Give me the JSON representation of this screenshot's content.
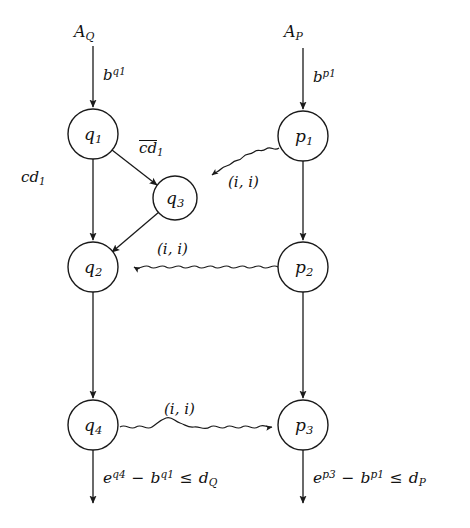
{
  "diagram": {
    "background_color": "#ffffff",
    "stroke_color": "#1a1a1a",
    "nodes": [
      {
        "id": "q1",
        "label": "q",
        "sub": "1",
        "cx": 93,
        "cy": 134,
        "r": 25
      },
      {
        "id": "q3",
        "label": "q",
        "sub": "3",
        "cx": 175,
        "cy": 198,
        "r": 22
      },
      {
        "id": "q2",
        "label": "q",
        "sub": "2",
        "cx": 93,
        "cy": 267,
        "r": 25
      },
      {
        "id": "q4",
        "label": "q",
        "sub": "4",
        "cx": 93,
        "cy": 425,
        "r": 25
      },
      {
        "id": "p1",
        "label": "p",
        "sub": "1",
        "cx": 303,
        "cy": 136,
        "r": 25
      },
      {
        "id": "p2",
        "label": "p",
        "sub": "2",
        "cx": 303,
        "cy": 267,
        "r": 25
      },
      {
        "id": "p3",
        "label": "p",
        "sub": "3",
        "cx": 303,
        "cy": 425,
        "r": 25
      }
    ],
    "entry_labels": [
      {
        "id": "entry-q",
        "text": "A",
        "sub": "Q",
        "x": 74,
        "y": 24
      },
      {
        "id": "entry-p",
        "text": "A",
        "sub": "P",
        "x": 284,
        "y": 24
      }
    ],
    "clock_labels": [
      {
        "id": "clock-bq1",
        "base": "b",
        "sup": "q1",
        "x": 103,
        "y": 67
      },
      {
        "id": "clock-bp1",
        "base": "b",
        "sup": "p1",
        "x": 313,
        "y": 69
      }
    ],
    "edge_labels": [
      {
        "id": "label-cd1",
        "text": "cd",
        "sub": "1",
        "overline": false,
        "x": 21,
        "y": 170
      },
      {
        "id": "label-cd1-bar",
        "text": "cd",
        "sub": "1",
        "overline": true,
        "x": 139,
        "y": 140
      }
    ],
    "sync_labels": [
      {
        "id": "sync-p1-q3",
        "text": "(i, i)",
        "x": 228,
        "y": 175
      },
      {
        "id": "sync-p2-q2",
        "text": "(i, i)",
        "x": 157,
        "y": 242
      },
      {
        "id": "sync-q4-p3",
        "text": "(i, i)",
        "x": 164,
        "y": 402
      }
    ],
    "guards": [
      {
        "id": "guard-q",
        "x": 103,
        "y": 469,
        "parts": [
          {
            "base": "e",
            "sup": "q4"
          },
          {
            "op": " − "
          },
          {
            "base": "b",
            "sup": "q1"
          },
          {
            "op": " ≤ "
          },
          {
            "base": "d",
            "sub": "Q"
          }
        ],
        "plain": "e^{q4} - b^{q1} <= d_Q"
      },
      {
        "id": "guard-p",
        "x": 313,
        "y": 469,
        "parts": [
          {
            "base": "e",
            "sup": "p3"
          },
          {
            "op": " − "
          },
          {
            "base": "b",
            "sup": "p1"
          },
          {
            "op": " ≤ "
          },
          {
            "base": "d",
            "sub": "P"
          }
        ],
        "plain": "e^{p3} - b^{p1} <= d_P"
      }
    ],
    "edges": [
      {
        "id": "edge-entry-q1",
        "type": "straight",
        "from": "entry",
        "to": "q1",
        "label": "b^{q1}"
      },
      {
        "id": "edge-entry-p1",
        "type": "straight",
        "from": "entry",
        "to": "p1",
        "label": "b^{p1}"
      },
      {
        "id": "edge-q1-q2",
        "type": "straight",
        "from": "q1",
        "to": "q2",
        "label": "cd1"
      },
      {
        "id": "edge-q1-q3",
        "type": "straight",
        "from": "q1",
        "to": "q3",
        "label": "cd1-bar"
      },
      {
        "id": "edge-q3-q2",
        "type": "straight",
        "from": "q3",
        "to": "q2",
        "label": ""
      },
      {
        "id": "edge-p1-q3",
        "type": "wavy",
        "from": "p1",
        "to": "q3",
        "label": "(i, i)"
      },
      {
        "id": "edge-p1-p2",
        "type": "straight",
        "from": "p1",
        "to": "p2",
        "label": ""
      },
      {
        "id": "edge-p2-q2",
        "type": "wavy",
        "from": "p2",
        "to": "q2",
        "label": "(i, i)"
      },
      {
        "id": "edge-q2-q4",
        "type": "straight",
        "from": "q2",
        "to": "q4",
        "label": ""
      },
      {
        "id": "edge-p2-p3",
        "type": "straight",
        "from": "p2",
        "to": "p3",
        "label": ""
      },
      {
        "id": "edge-q4-p3",
        "type": "wavy",
        "from": "q4",
        "to": "p3",
        "label": "(i, i)"
      },
      {
        "id": "edge-q4-exit",
        "type": "straight",
        "from": "q4",
        "to": "exit",
        "label": "guard-q"
      },
      {
        "id": "edge-p3-exit",
        "type": "straight",
        "from": "p3",
        "to": "exit",
        "label": "guard-p"
      }
    ]
  }
}
